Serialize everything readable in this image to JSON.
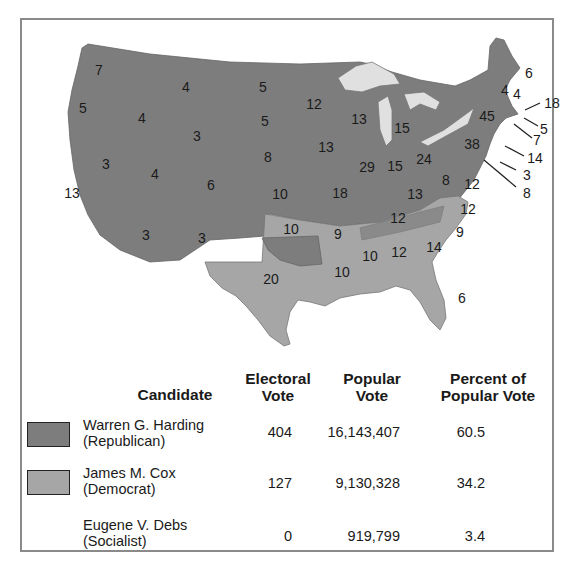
{
  "colors": {
    "republican": "#7d7d7d",
    "democrat": "#a6a6a6",
    "lakes": "#e0e0e0",
    "border": "#8a8a8a"
  },
  "map": {
    "title": "",
    "state_labels": [
      {
        "state": "WA",
        "ev": "7"
      },
      {
        "state": "OR",
        "ev": "5"
      },
      {
        "state": "CA",
        "ev": "13"
      },
      {
        "state": "ID",
        "ev": "4"
      },
      {
        "state": "NV",
        "ev": "3"
      },
      {
        "state": "MT",
        "ev": "4"
      },
      {
        "state": "WY",
        "ev": "3"
      },
      {
        "state": "UT",
        "ev": "4"
      },
      {
        "state": "AZ",
        "ev": "3"
      },
      {
        "state": "CO",
        "ev": "6"
      },
      {
        "state": "NM",
        "ev": "3"
      },
      {
        "state": "ND",
        "ev": "5"
      },
      {
        "state": "SD",
        "ev": "5"
      },
      {
        "state": "NE",
        "ev": "8"
      },
      {
        "state": "KS",
        "ev": "10"
      },
      {
        "state": "OK",
        "ev": "10"
      },
      {
        "state": "TX",
        "ev": "20"
      },
      {
        "state": "MN",
        "ev": "12"
      },
      {
        "state": "IA",
        "ev": "13"
      },
      {
        "state": "MO",
        "ev": "18"
      },
      {
        "state": "AR",
        "ev": "9"
      },
      {
        "state": "LA",
        "ev": "10"
      },
      {
        "state": "WI",
        "ev": "13"
      },
      {
        "state": "IL",
        "ev": "29"
      },
      {
        "state": "MI",
        "ev": "15"
      },
      {
        "state": "IN",
        "ev": "15"
      },
      {
        "state": "OH",
        "ev": "24"
      },
      {
        "state": "KY",
        "ev": "13"
      },
      {
        "state": "TN",
        "ev": "12"
      },
      {
        "state": "MS",
        "ev": "10"
      },
      {
        "state": "AL",
        "ev": "12"
      },
      {
        "state": "GA",
        "ev": "14"
      },
      {
        "state": "FL",
        "ev": "6"
      },
      {
        "state": "SC",
        "ev": "9"
      },
      {
        "state": "NC",
        "ev": "12"
      },
      {
        "state": "VA",
        "ev": "12"
      },
      {
        "state": "WV",
        "ev": "8"
      },
      {
        "state": "PA",
        "ev": "38"
      },
      {
        "state": "NY",
        "ev": "45"
      },
      {
        "state": "VT",
        "ev": "4"
      },
      {
        "state": "NH",
        "ev": "4"
      },
      {
        "state": "ME",
        "ev": "6"
      },
      {
        "state": "MA",
        "ev": "18"
      },
      {
        "state": "RI",
        "ev": "5"
      },
      {
        "state": "CT",
        "ev": "7"
      },
      {
        "state": "NJ",
        "ev": "14"
      },
      {
        "state": "DE",
        "ev": "3"
      },
      {
        "state": "MD",
        "ev": "8"
      }
    ]
  },
  "legend": {
    "headers": {
      "candidate": "Candidate",
      "electoral_1": "Electoral",
      "electoral_2": "Vote",
      "popular_1": "Popular",
      "popular_2": "Vote",
      "percent_1": "Percent of",
      "percent_2": "Popular Vote"
    },
    "rows": [
      {
        "name": "Warren G. Harding",
        "party": "(Republican)",
        "electoral": "404",
        "popular": "16,143,407",
        "percent": "60.5"
      },
      {
        "name": "James M. Cox",
        "party": "(Democrat)",
        "electoral": "127",
        "popular": "9,130,328",
        "percent": "34.2"
      },
      {
        "name": "Eugene V. Debs",
        "party": "(Socialist)",
        "electoral": "0",
        "popular": "919,799",
        "percent": "3.4"
      }
    ]
  }
}
